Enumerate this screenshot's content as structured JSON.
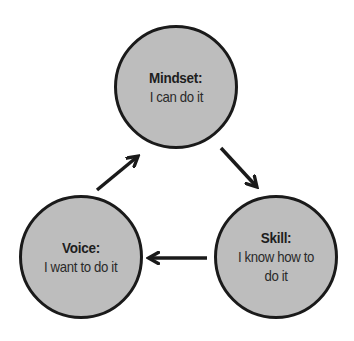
{
  "diagram": {
    "type": "cycle",
    "colors": {
      "node_fill": "#bdbdbd",
      "node_border": "#1a1a1a",
      "arrow": "#1a1a1a",
      "text": "#1e1e1e",
      "background": "#ffffff"
    },
    "nodes": [
      {
        "id": "mindset",
        "title": "Mindset:",
        "desc": "I can do it"
      },
      {
        "id": "skill",
        "title": "Skill:",
        "desc": "I know how to do it"
      },
      {
        "id": "voice",
        "title": "Voice:",
        "desc": "I want to do it"
      }
    ],
    "edges": [
      {
        "from": "mindset",
        "to": "skill"
      },
      {
        "from": "skill",
        "to": "voice"
      },
      {
        "from": "voice",
        "to": "mindset"
      }
    ]
  }
}
